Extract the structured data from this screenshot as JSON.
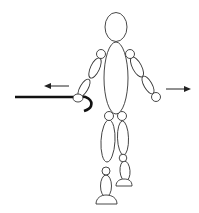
{
  "diagram": {
    "colors": {
      "background": "#ffffff",
      "outline": "#333333",
      "cane": "#111111",
      "arrow": "#222222"
    },
    "arrows": [
      {
        "name": "left-arrow",
        "direction": "left"
      },
      {
        "name": "right-arrow",
        "direction": "right"
      }
    ],
    "props": [
      {
        "name": "cane",
        "held_in": "right hand (viewer's left)"
      }
    ]
  }
}
